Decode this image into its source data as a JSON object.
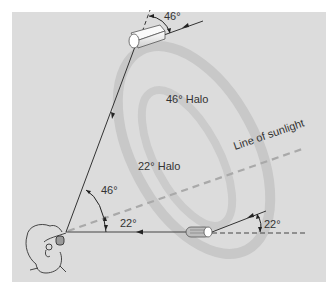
{
  "diagram": {
    "labels": {
      "halo_46": "46° Halo",
      "halo_22": "22° Halo",
      "sunlight_line": "Line of sunlight",
      "angle_top_crystal": "46°",
      "angle_eye_46": "46°",
      "angle_eye_22": "22°",
      "angle_bottom_crystal": "22°"
    },
    "colors": {
      "background_panel": "#dcdcdc",
      "page": "#ffffff",
      "halo_ring": "#c9c9c9",
      "ray": "#333333",
      "sunlight_dash": "#a8a8a8",
      "crystal": "#f4f4f4"
    }
  }
}
